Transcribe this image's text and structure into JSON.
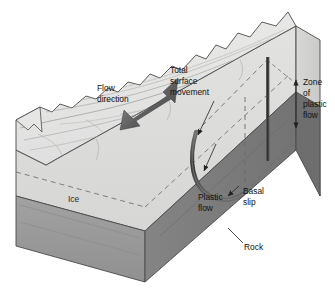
{
  "figure": {
    "background_color": "#ffffff"
  },
  "colors": {
    "ice_top": "#e4e4e2",
    "ice_front": "#dcdcda",
    "ice_right": "#d2d2d0",
    "rock_front": "#9a9a9a",
    "rock_right": "#7c7c7c",
    "outline": "#3a3a3a",
    "arrow_dark": "#5a5a5a",
    "curve_dark": "#4a4a4a",
    "bar_dark": "#3c3c3c",
    "dashed": "#55555a",
    "label_text": "#111111"
  },
  "labels": {
    "flow_direction": {
      "lines": [
        "Flow",
        "direction"
      ],
      "line1": "Flow",
      "line2": "direction"
    },
    "total_surface_movement": {
      "lines": [
        "Total",
        "surface",
        "movement"
      ],
      "line1": "Total",
      "line2": "surface",
      "line3": "movement"
    },
    "zone_of_plastic_flow": {
      "lines": [
        "Zone",
        "of",
        "plastic",
        "flow"
      ],
      "line1": "Zone",
      "line2": "of",
      "line3": "plastic",
      "line4": "flow"
    },
    "plastic_flow": {
      "lines": [
        "Plastic",
        "flow"
      ],
      "line1": "Plastic",
      "line2": "flow"
    },
    "basal_slip": {
      "lines": [
        "Basal",
        "slip"
      ],
      "line1": "Basal",
      "line2": "slip"
    },
    "ice": {
      "line1": "Ice"
    },
    "rock": {
      "line1": "Rock"
    }
  },
  "annotations": {
    "flow_arrow": "thick dark arrow on top surface pointing down-left, indicating direction of glacier flow",
    "velocity_profile_curve": "dark J-shaped curve showing how ice velocity decreases with depth",
    "dashed_reference_line": "vertical dashed line marking original undeformed position",
    "vertical_bar": "dark vertical bar on right face marking the reference column",
    "zone_arrow": "double-headed vertical arrow spanning the zone of plastic flow",
    "rock_leader": "leader line from Rock label to dark basal rock layer"
  }
}
